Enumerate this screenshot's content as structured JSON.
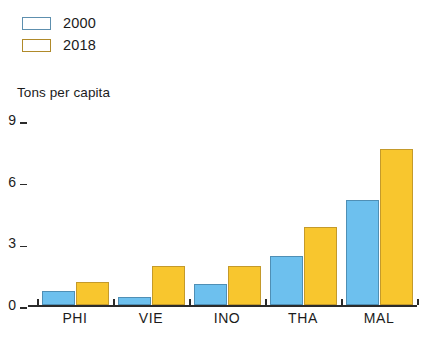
{
  "chart_data": {
    "type": "bar",
    "title": "",
    "subtitle": "",
    "xlabel": "",
    "ylabel": "Tons per capita",
    "ylim": [
      0,
      9
    ],
    "yticks": [
      0,
      3,
      6,
      9
    ],
    "ytick_labels": [
      "0",
      "3",
      "6",
      "9"
    ],
    "grid": false,
    "legend_position": "top-left",
    "categories": [
      "PHI",
      "VIE",
      "INO",
      "THA",
      "MAL"
    ],
    "series": [
      {
        "name": "2000",
        "color": "#6DC0EE",
        "values": [
          0.7,
          0.4,
          1.0,
          2.4,
          5.1
        ]
      },
      {
        "name": "2018",
        "color": "#F8C62E",
        "values": [
          1.1,
          1.9,
          1.9,
          3.8,
          7.6
        ]
      }
    ]
  },
  "legend": {
    "items": [
      {
        "label": "2000",
        "swatch": "blue-swatch"
      },
      {
        "label": "2018",
        "swatch": "yellow-swatch"
      }
    ]
  },
  "axis": {
    "y_title": "Tons per capita"
  },
  "colors": {
    "series_2000": "#6DC0EE",
    "series_2018": "#F8C62E",
    "axis": "#2B2B2B",
    "background": "#FFFFFF"
  }
}
